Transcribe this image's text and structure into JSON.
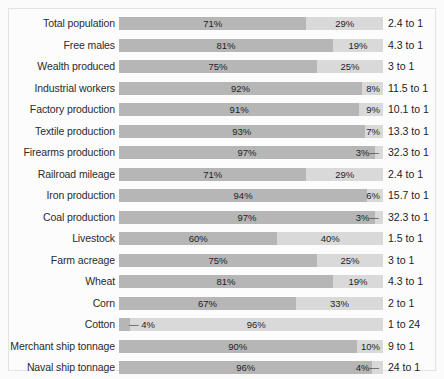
{
  "chart_data": {
    "type": "bar",
    "title": "",
    "subtitle": "",
    "xlabel": "",
    "ylabel": "",
    "xlim": [
      0,
      100
    ],
    "grid": false,
    "legend_position": "none",
    "orientation": "horizontal",
    "stacked": true,
    "series": [
      {
        "name": "North",
        "color": "#b6b6b6"
      },
      {
        "name": "South",
        "color": "#d9d9d9"
      }
    ],
    "categories": [
      "Total population",
      "Free males",
      "Wealth produced",
      "Industrial workers",
      "Factory production",
      "Textile production",
      "Firearms production",
      "Railroad mileage",
      "Iron production",
      "Coal production",
      "Livestock",
      "Farm acreage",
      "Wheat",
      "Corn",
      "Cotton",
      "Merchant ship tonnage",
      "Naval ship tonnage"
    ],
    "rows": [
      {
        "label": "Total population",
        "left_value": 71,
        "right_value": 29,
        "left_label": "71%",
        "right_label": "29%",
        "ratio": "2.4 to 1",
        "left_tick": false,
        "right_tick": false
      },
      {
        "label": "Free males",
        "left_value": 81,
        "right_value": 19,
        "left_label": "81%",
        "right_label": "19%",
        "ratio": "4.3 to 1",
        "left_tick": false,
        "right_tick": false
      },
      {
        "label": "Wealth produced",
        "left_value": 75,
        "right_value": 25,
        "left_label": "75%",
        "right_label": "25%",
        "ratio": "3 to 1",
        "left_tick": false,
        "right_tick": false
      },
      {
        "label": "Industrial workers",
        "left_value": 92,
        "right_value": 8,
        "left_label": "92%",
        "right_label": "8%",
        "ratio": "11.5 to 1",
        "left_tick": false,
        "right_tick": false
      },
      {
        "label": "Factory production",
        "left_value": 91,
        "right_value": 9,
        "left_label": "91%",
        "right_label": "9%",
        "ratio": "10.1 to 1",
        "left_tick": false,
        "right_tick": false
      },
      {
        "label": "Textile production",
        "left_value": 93,
        "right_value": 7,
        "left_label": "93%",
        "right_label": "7%",
        "ratio": "13.3 to 1",
        "left_tick": false,
        "right_tick": false
      },
      {
        "label": "Firearms production",
        "left_value": 97,
        "right_value": 3,
        "left_label": "97%",
        "right_label": "3%",
        "ratio": "32.3 to 1",
        "left_tick": false,
        "right_tick": true
      },
      {
        "label": "Railroad mileage",
        "left_value": 71,
        "right_value": 29,
        "left_label": "71%",
        "right_label": "29%",
        "ratio": "2.4 to 1",
        "left_tick": false,
        "right_tick": false
      },
      {
        "label": "Iron production",
        "left_value": 94,
        "right_value": 6,
        "left_label": "94%",
        "right_label": "6%",
        "ratio": "15.7 to 1",
        "left_tick": false,
        "right_tick": false
      },
      {
        "label": "Coal production",
        "left_value": 97,
        "right_value": 3,
        "left_label": "97%",
        "right_label": "3%",
        "ratio": "32.3 to 1",
        "left_tick": false,
        "right_tick": true
      },
      {
        "label": "Livestock",
        "left_value": 60,
        "right_value": 40,
        "left_label": "60%",
        "right_label": "40%",
        "ratio": "1.5 to 1",
        "left_tick": false,
        "right_tick": false
      },
      {
        "label": "Farm acreage",
        "left_value": 75,
        "right_value": 25,
        "left_label": "75%",
        "right_label": "25%",
        "ratio": "3 to 1",
        "left_tick": false,
        "right_tick": false
      },
      {
        "label": "Wheat",
        "left_value": 81,
        "right_value": 19,
        "left_label": "81%",
        "right_label": "19%",
        "ratio": "4.3 to 1",
        "left_tick": false,
        "right_tick": false
      },
      {
        "label": "Corn",
        "left_value": 67,
        "right_value": 33,
        "left_label": "67%",
        "right_label": "33%",
        "ratio": "2 to 1",
        "left_tick": false,
        "right_tick": false
      },
      {
        "label": "Cotton",
        "left_value": 4,
        "right_value": 96,
        "left_label": "4%",
        "right_label": "96%",
        "ratio": "1 to 24",
        "left_tick": true,
        "right_tick": false
      },
      {
        "label": "Merchant ship tonnage",
        "left_value": 90,
        "right_value": 10,
        "left_label": "90%",
        "right_label": "10%",
        "ratio": "9 to 1",
        "left_tick": false,
        "right_tick": false
      },
      {
        "label": "Naval ship tonnage",
        "left_value": 96,
        "right_value": 4,
        "left_label": "96%",
        "right_label": "4%",
        "ratio": "24 to 1",
        "left_tick": false,
        "right_tick": true
      }
    ],
    "tick_glyph": "—"
  },
  "colors": {
    "background": "#fbfbfb",
    "panel": "#fcfcfc",
    "border": "#e3e3e3",
    "segment_dark": "#b6b6b6",
    "segment_light": "#d9d9d9",
    "text": "#222222"
  }
}
